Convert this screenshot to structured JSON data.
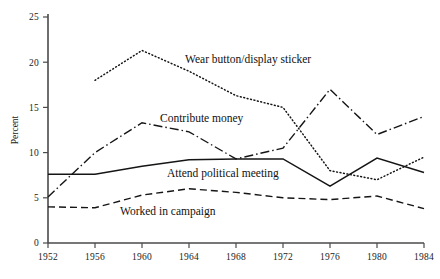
{
  "chart_data": {
    "type": "line",
    "title": "",
    "subtitle": "",
    "xlabel": "",
    "ylabel": "Percent",
    "x": [
      1952,
      1956,
      1960,
      1964,
      1968,
      1972,
      1976,
      1980,
      1984
    ],
    "xtick_labels": [
      "1952",
      "1956",
      "1960",
      "1964",
      "1968",
      "1972",
      "1976",
      "1980",
      "1984"
    ],
    "ytick_labels": [
      "0",
      "5",
      "10",
      "15",
      "20",
      "25"
    ],
    "ytick_values": [
      0,
      5,
      10,
      15,
      20,
      25
    ],
    "xlim": [
      1952,
      1984
    ],
    "ylim": [
      0,
      25
    ],
    "grid": false,
    "legend_position": "inline-annotations",
    "series": [
      {
        "name": "Wear button/display sticker",
        "style": "dotted",
        "label_text": "Wear button/display sticker",
        "x": [
          1956,
          1960,
          1964,
          1968,
          1972,
          1976,
          1980,
          1984
        ],
        "values": [
          18.0,
          21.3,
          19.0,
          16.3,
          15.0,
          8.0,
          7.0,
          9.5
        ]
      },
      {
        "name": "Contribute money",
        "style": "dash-dot",
        "label_text": "Contribute money",
        "x": [
          1952,
          1956,
          1960,
          1964,
          1968,
          1972,
          1976,
          1980,
          1984
        ],
        "values": [
          5.1,
          10.0,
          13.3,
          12.3,
          9.3,
          10.5,
          17.0,
          12.0,
          14.0
        ]
      },
      {
        "name": "Attend political meeting",
        "style": "solid",
        "label_text": "Attend political meeting",
        "x": [
          1952,
          1956,
          1960,
          1964,
          1968,
          1972,
          1976,
          1980,
          1984
        ],
        "values": [
          7.6,
          7.6,
          8.5,
          9.2,
          9.3,
          9.3,
          6.3,
          9.4,
          7.8
        ]
      },
      {
        "name": "Worked in campaign",
        "style": "dashed",
        "label_text": "Worked in campaign",
        "x": [
          1952,
          1956,
          1960,
          1964,
          1968,
          1972,
          1976,
          1980,
          1984
        ],
        "values": [
          4.0,
          3.9,
          5.3,
          6.0,
          5.6,
          5.0,
          4.8,
          5.2,
          3.8
        ]
      }
    ],
    "annotations": [
      {
        "text": "Wear button/display sticker",
        "x_px": 185,
        "y_px": 63
      },
      {
        "text": "Contribute money",
        "x_px": 160,
        "y_px": 122
      },
      {
        "text": "Attend political meeting",
        "x_px": 167,
        "y_px": 177
      },
      {
        "text": "Worked in campaign",
        "x_px": 120,
        "y_px": 215
      }
    ]
  }
}
